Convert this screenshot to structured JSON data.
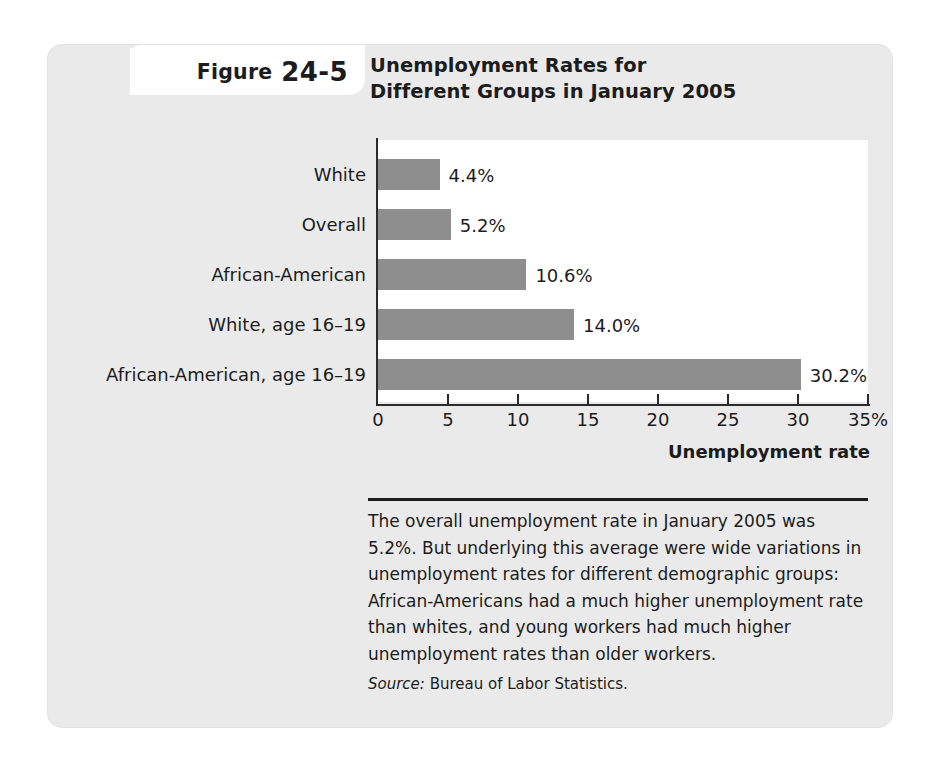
{
  "figure": {
    "label_word": "Figure",
    "label_number": "24-5"
  },
  "chart_data": {
    "type": "bar",
    "orientation": "horizontal",
    "title": "Unemployment Rates for\nDifferent Groups in January 2005",
    "title_line1": "Unemployment Rates for",
    "title_line2": "Different Groups in January 2005",
    "categories": [
      "White",
      "Overall",
      "African-American",
      "White, age 16–19",
      "African-American, age 16–19"
    ],
    "values": [
      4.4,
      5.2,
      10.6,
      14.0,
      30.2
    ],
    "value_labels": [
      "4.4%",
      "5.2%",
      "10.6%",
      "14.0%",
      "30.2%"
    ],
    "xlabel": "Unemployment rate",
    "ylabel": "",
    "xlim": [
      0,
      35
    ],
    "xticks": [
      0,
      5,
      10,
      15,
      20,
      25,
      30,
      35
    ],
    "xtick_labels": [
      "0",
      "5",
      "10",
      "15",
      "20",
      "25",
      "30",
      "35%"
    ],
    "grid": false,
    "legend": null,
    "bar_color": "#8e8e8e",
    "axis_color": "#2b2b2b",
    "plot_background": "#ffffff",
    "panel_background": "#eaeaea"
  },
  "caption": {
    "body": "The overall unemployment rate in January 2005 was 5.2%. But underlying this average were wide variations in unemployment rates for different demographic groups: African-Americans had a much higher unemployment rate than whites, and young workers had much higher unemployment rates than older workers.",
    "source_label": "Source:",
    "source_value": "Bureau of Labor Statistics."
  }
}
